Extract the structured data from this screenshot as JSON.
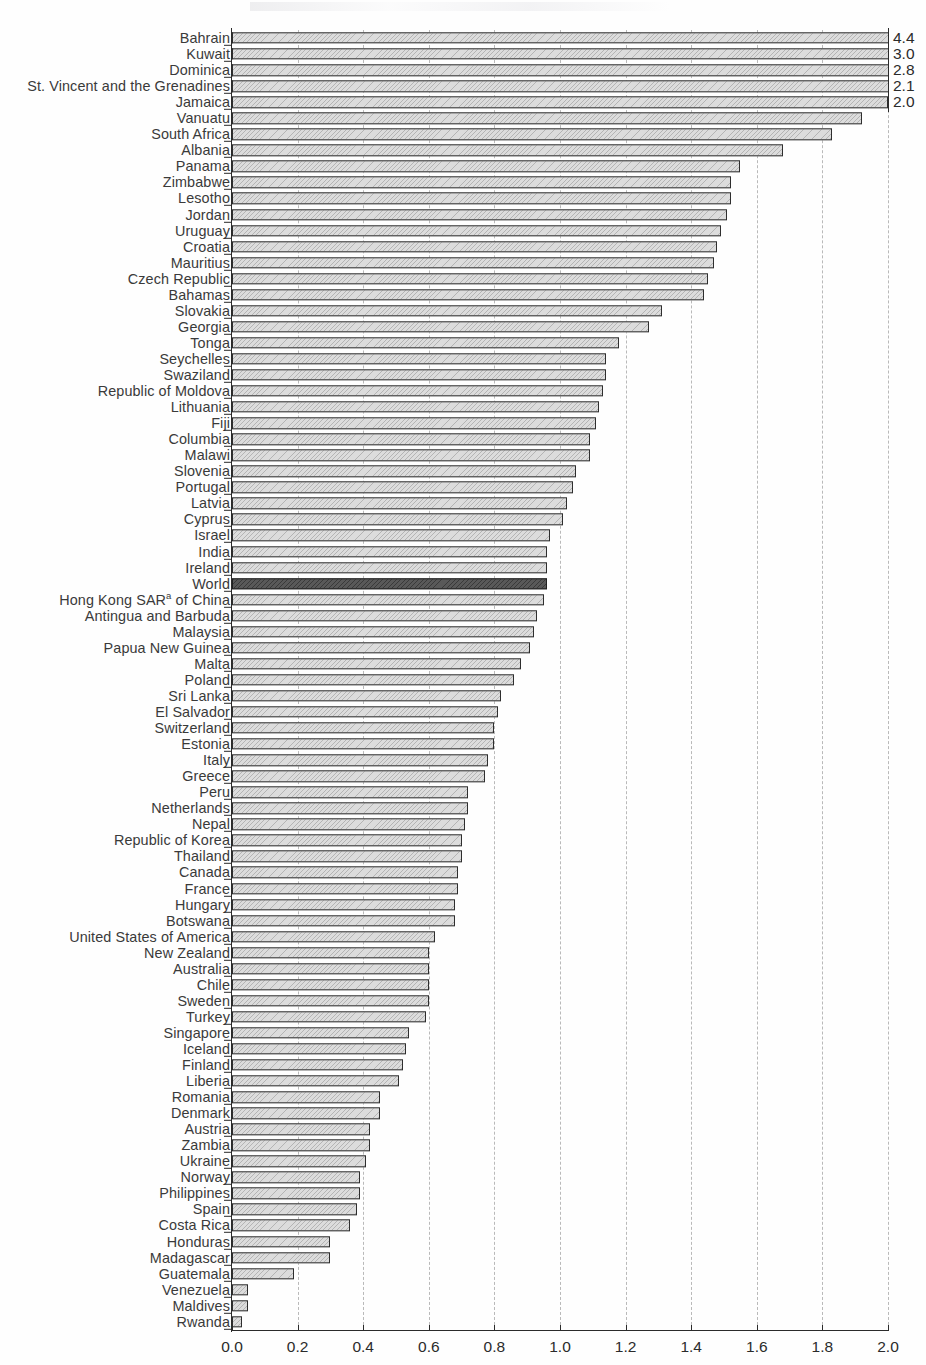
{
  "chart_data": {
    "type": "bar",
    "orientation": "horizontal",
    "title": "",
    "xlabel": "",
    "ylabel": "",
    "xlim": [
      0.0,
      2.0
    ],
    "grid": true,
    "legend": null,
    "axis_ticks": [
      "0.0",
      "0.2",
      "0.4",
      "0.6",
      "0.8",
      "1.0",
      "1.2",
      "1.4",
      "1.6",
      "1.8",
      "2.0"
    ],
    "axis_tick_values": [
      0.0,
      0.2,
      0.4,
      0.6,
      0.8,
      1.0,
      1.2,
      1.4,
      1.6,
      1.8,
      2.0
    ],
    "highlight_category": "World",
    "highlight_color": "#595959",
    "bar_color": "#dcdcdc",
    "note": "Bars exceeding the 2.0 axis maximum are clipped and annotated with their value at the right edge.",
    "categories": [
      "Bahrain",
      "Kuwait",
      "Dominica",
      "St. Vincent and the Grenadines",
      "Jamaica",
      "Vanuatu",
      "South Africa",
      "Albania",
      "Panama",
      "Zimbabwe",
      "Lesotho",
      "Jordan",
      "Uruguay",
      "Croatia",
      "Mauritius",
      "Czech Republic",
      "Bahamas",
      "Slovakia",
      "Georgia",
      "Tonga",
      "Seychelles",
      "Swaziland",
      "Republic of Moldova",
      "Lithuania",
      "Fiji",
      "Columbia",
      "Malawi",
      "Slovenia",
      "Portugal",
      "Latvia",
      "Cyprus",
      "Israel",
      "India",
      "Ireland",
      "World",
      "Hong Kong SAR of China",
      "Antingua and Barbuda",
      "Malaysia",
      "Papua New Guinea",
      "Malta",
      "Poland",
      "Sri Lanka",
      "El Salvador",
      "Switzerland",
      "Estonia",
      "Italy",
      "Greece",
      "Peru",
      "Netherlands",
      "Nepal",
      "Republic of Korea",
      "Thailand",
      "Canada",
      "France",
      "Hungary",
      "Botswana",
      "United States of America",
      "New Zealand",
      "Australia",
      "Chile",
      "Sweden",
      "Turkey",
      "Singapore",
      "Iceland",
      "Finland",
      "Liberia",
      "Romania",
      "Denmark",
      "Austria",
      "Zambia",
      "Ukraine",
      "Norway",
      "Philippines",
      "Spain",
      "Costa Rica",
      "Honduras",
      "Madagascar",
      "Guatemala",
      "Venezuela",
      "Maldives",
      "Rwanda"
    ],
    "values": [
      4.4,
      3.0,
      2.8,
      2.1,
      2.0,
      1.92,
      1.83,
      1.68,
      1.55,
      1.52,
      1.52,
      1.51,
      1.49,
      1.48,
      1.47,
      1.45,
      1.44,
      1.31,
      1.27,
      1.18,
      1.14,
      1.14,
      1.13,
      1.12,
      1.11,
      1.09,
      1.09,
      1.05,
      1.04,
      1.02,
      1.01,
      0.97,
      0.96,
      0.96,
      0.96,
      0.95,
      0.93,
      0.92,
      0.91,
      0.88,
      0.86,
      0.82,
      0.81,
      0.8,
      0.8,
      0.78,
      0.77,
      0.72,
      0.72,
      0.71,
      0.7,
      0.7,
      0.69,
      0.69,
      0.68,
      0.68,
      0.62,
      0.6,
      0.6,
      0.6,
      0.6,
      0.59,
      0.54,
      0.53,
      0.52,
      0.51,
      0.45,
      0.45,
      0.42,
      0.42,
      0.41,
      0.39,
      0.39,
      0.38,
      0.36,
      0.3,
      0.3,
      0.19,
      0.05,
      0.05,
      0.03
    ],
    "value_labels": {
      "Bahrain": "4.4",
      "Kuwait": "3.0",
      "Dominica": "2.8",
      "St. Vincent and the Grenadines": "2.1",
      "Jamaica": "2.0"
    },
    "footnote_markers": {
      "Hong Kong SAR of China": "a"
    }
  }
}
